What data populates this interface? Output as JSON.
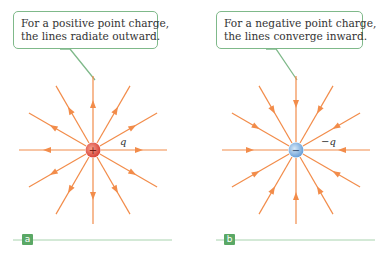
{
  "panels": [
    {
      "id": "a",
      "callout": [
        "For a positive point charge,",
        "the lines radiate outward."
      ],
      "charge_label": "q",
      "charge_sign": "+",
      "direction": "outward",
      "charge_color": "#e8604f"
    },
    {
      "id": "b",
      "callout": [
        "For a negative point charge,",
        "the lines converge inward."
      ],
      "charge_label": "−q",
      "charge_sign": "−",
      "direction": "inward",
      "charge_color": "#7fb0e0"
    }
  ],
  "colors": {
    "field_line": "#f28c4a",
    "callout_border": "#7fb98a",
    "panel_label_bg": "#5aa865",
    "baseline": "#a8d3ae"
  }
}
